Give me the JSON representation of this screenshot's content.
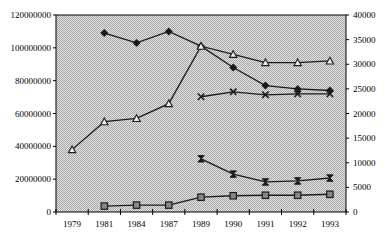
{
  "chart_data": {
    "type": "line",
    "title": "",
    "xlabel": "",
    "ylabel": "",
    "ylabel_right": "",
    "categories": [
      "1979",
      "1981",
      "1984",
      "1987",
      "1989",
      "1990",
      "1991",
      "1992",
      "1993"
    ],
    "ylim": [
      0,
      120000000
    ],
    "ylim_right": [
      0,
      40000
    ],
    "yticks_left": [
      "0",
      "20000000",
      "40000000",
      "60000000",
      "80000000",
      "100000000",
      "120000000"
    ],
    "yticks_right": [
      "0",
      "5000",
      "10000",
      "15000",
      "20000",
      "25000",
      "30000",
      "35000",
      "40000"
    ],
    "grid": false,
    "legend": null,
    "plot_background": "#d9d9d9 dotted pattern",
    "series": [
      {
        "name": "series-diamond",
        "marker": "diamond",
        "axis": "left",
        "values": [
          null,
          109000000,
          103000000,
          110000000,
          101000000,
          88000000,
          77000000,
          75000000,
          74000000
        ]
      },
      {
        "name": "series-triangle",
        "marker": "triangle",
        "axis": "left",
        "values": [
          38000000,
          55000000,
          57000000,
          66000000,
          101000000,
          96000000,
          91000000,
          91000000,
          92000000
        ]
      },
      {
        "name": "series-x",
        "marker": "x",
        "axis": "right",
        "values": [
          null,
          null,
          null,
          null,
          23400,
          24400,
          23800,
          24000,
          24000
        ]
      },
      {
        "name": "series-hourglass",
        "marker": "hourglass",
        "axis": "right",
        "values": [
          null,
          null,
          null,
          null,
          10800,
          7700,
          6100,
          6300,
          6900
        ]
      },
      {
        "name": "series-square",
        "marker": "square",
        "axis": "right",
        "values": [
          null,
          1200,
          1400,
          1400,
          3000,
          3300,
          3400,
          3400,
          3600
        ]
      }
    ]
  },
  "colors": {
    "line": "#1a1a1a",
    "plot_bg": "#d4d4d4",
    "plot_dot": "#b8b8b8",
    "axis": "#000000"
  }
}
